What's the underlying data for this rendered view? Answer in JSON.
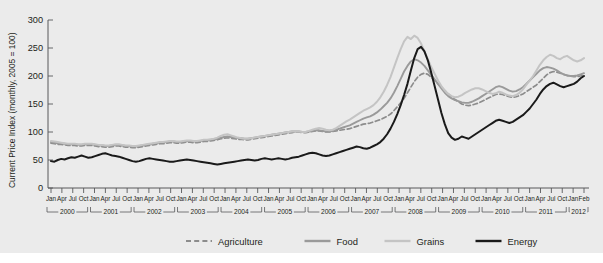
{
  "chart_data": {
    "type": "line",
    "title": "",
    "xlabel": "",
    "ylabel": "Current Price Index (monthly, 2005 = 100)",
    "ylim": [
      0,
      300
    ],
    "yticks": [
      0,
      50,
      100,
      150,
      200,
      250,
      300
    ],
    "grid": false,
    "legend_position": "bottom",
    "axis_color": "#58595b",
    "background_color": "#ebebeb",
    "x_tick_labels": [
      "Jan",
      "Apr",
      "Jul",
      "Oct",
      "Jan",
      "Apr",
      "Jul",
      "Oct",
      "Jan",
      "Apr",
      "Jul",
      "Oct",
      "Jan",
      "Apr",
      "Jul",
      "Oct",
      "Jan",
      "Apr",
      "Jul",
      "Oct",
      "Jan",
      "Apr",
      "Jul",
      "Oct",
      "Jan",
      "Apr",
      "Jul",
      "Oct",
      "Jan",
      "Apr",
      "Jul",
      "Oct",
      "Jan",
      "Apr",
      "Jul",
      "Oct",
      "Jan",
      "Apr",
      "Jul",
      "Oct",
      "Jan",
      "Apr",
      "Jul",
      "Oct",
      "Jan",
      "Apr",
      "Jul",
      "Oct",
      "Jan",
      "Feb"
    ],
    "year_groups": [
      {
        "label": "2000",
        "start_index": 0,
        "end_index": 3
      },
      {
        "label": "2001",
        "start_index": 4,
        "end_index": 7
      },
      {
        "label": "2002",
        "start_index": 8,
        "end_index": 11
      },
      {
        "label": "2003",
        "start_index": 12,
        "end_index": 15
      },
      {
        "label": "2004",
        "start_index": 16,
        "end_index": 19
      },
      {
        "label": "2005",
        "start_index": 20,
        "end_index": 23
      },
      {
        "label": "2006",
        "start_index": 24,
        "end_index": 27
      },
      {
        "label": "2007",
        "start_index": 28,
        "end_index": 31
      },
      {
        "label": "2008",
        "start_index": 32,
        "end_index": 35
      },
      {
        "label": "2009",
        "start_index": 36,
        "end_index": 39
      },
      {
        "label": "2010",
        "start_index": 40,
        "end_index": 43
      },
      {
        "label": "2011",
        "start_index": 44,
        "end_index": 47
      },
      {
        "label": "2012",
        "start_index": 48,
        "end_index": 49
      }
    ],
    "x_start_year": 2000,
    "x_start_month": 1,
    "x_end_year": 2012,
    "x_end_month": 2,
    "n_points": 146,
    "series": [
      {
        "name": "Agriculture",
        "color": "#8c8c8c",
        "style": "dashed",
        "width": 1.7,
        "values": [
          80,
          79,
          78,
          78,
          77,
          76,
          76,
          76,
          75,
          75,
          76,
          76,
          76,
          75,
          74,
          74,
          73,
          73,
          74,
          75,
          75,
          74,
          73,
          73,
          72,
          72,
          73,
          74,
          75,
          76,
          77,
          78,
          79,
          79,
          80,
          81,
          81,
          80,
          80,
          81,
          82,
          82,
          81,
          81,
          82,
          83,
          83,
          84,
          85,
          86,
          88,
          89,
          90,
          89,
          88,
          87,
          87,
          86,
          86,
          87,
          88,
          89,
          90,
          91,
          92,
          93,
          94,
          95,
          96,
          97,
          98,
          99,
          100,
          100,
          99,
          99,
          100,
          101,
          102,
          102,
          101,
          100,
          100,
          101,
          102,
          103,
          104,
          105,
          106,
          108,
          110,
          112,
          114,
          115,
          116,
          118,
          120,
          122,
          125,
          128,
          132,
          138,
          145,
          152,
          160,
          170,
          180,
          190,
          198,
          203,
          205,
          203,
          198,
          192,
          186,
          180,
          174,
          168,
          162,
          158,
          154,
          150,
          148,
          147,
          148,
          150,
          152,
          155,
          158,
          161,
          164,
          167,
          168,
          167,
          165,
          163,
          162,
          163,
          165,
          168,
          172,
          176,
          180,
          184,
          190,
          196,
          202,
          206,
          208,
          207,
          205,
          203,
          201,
          200,
          199,
          199,
          200,
          201
        ]
      },
      {
        "name": "Food",
        "color": "#9a9a9a",
        "style": "solid",
        "width": 1.9,
        "values": [
          82,
          81,
          80,
          80,
          79,
          78,
          78,
          78,
          77,
          77,
          78,
          78,
          78,
          77,
          76,
          76,
          75,
          75,
          76,
          77,
          77,
          76,
          75,
          75,
          74,
          74,
          75,
          76,
          77,
          78,
          79,
          80,
          81,
          81,
          82,
          83,
          83,
          82,
          82,
          83,
          84,
          84,
          83,
          83,
          84,
          85,
          85,
          86,
          87,
          88,
          90,
          91,
          92,
          91,
          90,
          89,
          89,
          88,
          88,
          89,
          90,
          91,
          92,
          93,
          94,
          95,
          96,
          97,
          98,
          99,
          100,
          101,
          101,
          101,
          100,
          100,
          101,
          102,
          103,
          103,
          102,
          101,
          101,
          102,
          104,
          106,
          108,
          110,
          112,
          115,
          118,
          121,
          124,
          126,
          128,
          131,
          135,
          140,
          146,
          152,
          160,
          170,
          182,
          195,
          208,
          218,
          226,
          230,
          228,
          224,
          218,
          210,
          202,
          194,
          186,
          178,
          170,
          164,
          160,
          157,
          155,
          153,
          152,
          152,
          154,
          157,
          160,
          164,
          168,
          172,
          176,
          180,
          182,
          180,
          177,
          174,
          172,
          173,
          176,
          180,
          186,
          192,
          198,
          204,
          210,
          214,
          216,
          215,
          213,
          210,
          206,
          203,
          201,
          200,
          200,
          201,
          203,
          205
        ]
      },
      {
        "name": "Grains",
        "color": "#c4c4c4",
        "style": "solid",
        "width": 2.0,
        "values": [
          84,
          83,
          82,
          81,
          80,
          79,
          79,
          79,
          78,
          78,
          79,
          79,
          79,
          78,
          77,
          77,
          76,
          76,
          77,
          78,
          78,
          77,
          76,
          76,
          75,
          75,
          76,
          77,
          78,
          79,
          80,
          81,
          82,
          82,
          83,
          84,
          84,
          83,
          83,
          84,
          85,
          85,
          84,
          84,
          85,
          86,
          86,
          87,
          88,
          90,
          93,
          95,
          96,
          94,
          92,
          90,
          89,
          88,
          88,
          89,
          90,
          91,
          92,
          93,
          94,
          95,
          96,
          97,
          98,
          99,
          100,
          101,
          101,
          101,
          100,
          100,
          102,
          104,
          106,
          107,
          106,
          104,
          103,
          104,
          107,
          111,
          115,
          119,
          122,
          126,
          130,
          134,
          138,
          141,
          144,
          148,
          154,
          162,
          172,
          184,
          198,
          215,
          232,
          248,
          262,
          270,
          266,
          272,
          268,
          258,
          244,
          230,
          216,
          204,
          192,
          182,
          174,
          168,
          164,
          162,
          163,
          166,
          170,
          173,
          176,
          178,
          178,
          176,
          173,
          170,
          168,
          169,
          172,
          170,
          167,
          165,
          164,
          166,
          170,
          176,
          184,
          192,
          200,
          210,
          220,
          228,
          234,
          238,
          236,
          232,
          230,
          234,
          236,
          232,
          228,
          226,
          228,
          232
        ]
      },
      {
        "name": "Energy",
        "color": "#1a1a1a",
        "style": "solid",
        "width": 2.0,
        "values": [
          48,
          47,
          50,
          52,
          51,
          53,
          55,
          54,
          56,
          58,
          56,
          54,
          55,
          57,
          59,
          61,
          62,
          60,
          58,
          57,
          56,
          54,
          52,
          50,
          48,
          47,
          48,
          50,
          52,
          53,
          52,
          51,
          50,
          49,
          48,
          47,
          47,
          48,
          49,
          50,
          51,
          50,
          49,
          48,
          47,
          46,
          45,
          44,
          43,
          42,
          43,
          44,
          45,
          46,
          47,
          48,
          49,
          50,
          51,
          50,
          49,
          50,
          52,
          53,
          52,
          51,
          52,
          53,
          52,
          51,
          52,
          54,
          55,
          56,
          58,
          60,
          62,
          63,
          62,
          60,
          58,
          57,
          58,
          60,
          62,
          64,
          66,
          68,
          70,
          72,
          74,
          73,
          71,
          70,
          72,
          75,
          78,
          82,
          88,
          96,
          106,
          118,
          132,
          148,
          166,
          186,
          210,
          232,
          248,
          252,
          244,
          228,
          206,
          182,
          158,
          134,
          114,
          98,
          90,
          86,
          88,
          92,
          90,
          88,
          92,
          96,
          100,
          104,
          108,
          112,
          116,
          120,
          122,
          120,
          118,
          116,
          118,
          122,
          126,
          130,
          136,
          142,
          150,
          158,
          168,
          176,
          182,
          186,
          188,
          185,
          182,
          180,
          182,
          184,
          186,
          190,
          196,
          200
        ]
      }
    ]
  },
  "legend": {
    "items": [
      {
        "label": "Agriculture",
        "color": "#8c8c8c",
        "style": "dashed"
      },
      {
        "label": "Food",
        "color": "#9a9a9a",
        "style": "solid"
      },
      {
        "label": "Grains",
        "color": "#c4c4c4",
        "style": "solid"
      },
      {
        "label": "Energy",
        "color": "#1a1a1a",
        "style": "solid"
      }
    ]
  }
}
